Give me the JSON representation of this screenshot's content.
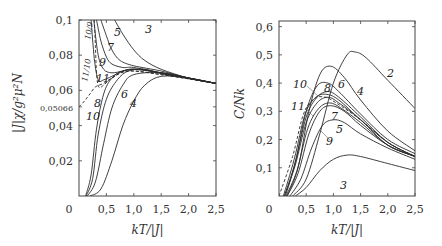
{
  "chart_data": [
    {
      "type": "line",
      "title": "",
      "xlabel": "kT/|J|",
      "ylabel": "|J|χ/g²μ²N",
      "xlim": [
        0,
        2.5
      ],
      "ylim": [
        0,
        0.1
      ],
      "xticks": [
        "0",
        "0,5",
        "1,0",
        "1,5",
        "2,0",
        "2,5"
      ],
      "yticks": [
        "0,02",
        "0,04",
        "0,05066",
        "0,06",
        "0,08",
        "0,1"
      ],
      "grid": false,
      "annotations": [
        "11/10",
        "10/9"
      ],
      "series": [
        {
          "name": "3",
          "style": "solid",
          "x": [
            0.65,
            0.8,
            1.0,
            1.2,
            1.5,
            2.0,
            2.5
          ],
          "y": [
            0.1,
            0.092,
            0.083,
            0.077,
            0.072,
            0.067,
            0.064
          ]
        },
        {
          "name": "5",
          "style": "solid",
          "x": [
            0.4,
            0.5,
            0.6,
            0.75,
            1.0,
            1.5,
            2.0,
            2.5
          ],
          "y": [
            0.1,
            0.091,
            0.083,
            0.077,
            0.074,
            0.071,
            0.067,
            0.064
          ]
        },
        {
          "name": "7",
          "style": "solid",
          "x": [
            0.32,
            0.4,
            0.5,
            0.6,
            0.8,
            1.0,
            1.5,
            2.5
          ],
          "y": [
            0.1,
            0.088,
            0.079,
            0.075,
            0.073,
            0.073,
            0.07,
            0.064
          ]
        },
        {
          "name": "9",
          "style": "solid",
          "x": [
            0.27,
            0.35,
            0.45,
            0.6,
            0.8,
            1.0,
            1.5,
            2.5
          ],
          "y": [
            0.1,
            0.08,
            0.072,
            0.07,
            0.071,
            0.072,
            0.07,
            0.064
          ]
        },
        {
          "name": "11",
          "style": "solid",
          "x": [
            0.22,
            0.28,
            0.35,
            0.45,
            0.6,
            0.8,
            1.0,
            1.5,
            2.5
          ],
          "y": [
            0.1,
            0.078,
            0.066,
            0.066,
            0.068,
            0.071,
            0.072,
            0.07,
            0.064
          ]
        },
        {
          "name": "4",
          "style": "solid",
          "x": [
            0.2,
            0.4,
            0.6,
            0.8,
            1.0,
            1.2,
            1.5,
            2.0,
            2.5
          ],
          "y": [
            0.0,
            0.004,
            0.02,
            0.04,
            0.054,
            0.063,
            0.068,
            0.067,
            0.064
          ]
        },
        {
          "name": "6",
          "style": "solid",
          "x": [
            0.15,
            0.3,
            0.45,
            0.6,
            0.8,
            1.0,
            1.5,
            2.0,
            2.5
          ],
          "y": [
            0.0,
            0.008,
            0.03,
            0.05,
            0.063,
            0.069,
            0.07,
            0.067,
            0.064
          ]
        },
        {
          "name": "8",
          "style": "solid",
          "x": [
            0.13,
            0.25,
            0.35,
            0.5,
            0.7,
            0.9,
            1.2,
            1.6,
            2.5
          ],
          "y": [
            0.0,
            0.01,
            0.035,
            0.055,
            0.066,
            0.071,
            0.072,
            0.069,
            0.064
          ]
        },
        {
          "name": "10",
          "style": "solid",
          "x": [
            0.12,
            0.22,
            0.32,
            0.45,
            0.6,
            0.8,
            1.1,
            1.6,
            2.5
          ],
          "y": [
            0.0,
            0.012,
            0.038,
            0.058,
            0.067,
            0.071,
            0.072,
            0.069,
            0.064
          ]
        },
        {
          "name": "10/9",
          "style": "dashed",
          "x": [
            0.28,
            0.3,
            0.32,
            0.36,
            0.45,
            0.6,
            0.9,
            1.5,
            2.5
          ],
          "y": [
            0.1,
            0.085,
            0.07,
            0.062,
            0.063,
            0.067,
            0.071,
            0.069,
            0.064
          ]
        },
        {
          "name": "11/10",
          "style": "dashed",
          "x": [
            0.0,
            0.1,
            0.2,
            0.3,
            0.45,
            0.6,
            0.9,
            1.5,
            2.5
          ],
          "y": [
            0.05066,
            0.054,
            0.058,
            0.062,
            0.064,
            0.067,
            0.071,
            0.069,
            0.064
          ]
        }
      ]
    },
    {
      "type": "line",
      "title": "",
      "xlabel": "kT/|J|",
      "ylabel": "C/Nk",
      "xlim": [
        0,
        2.5
      ],
      "ylim": [
        0,
        0.62
      ],
      "xticks": [
        "0",
        "0,5",
        "1,0",
        "1,5",
        "2,0",
        "2,5"
      ],
      "yticks": [
        "0,1",
        "0,2",
        "0,3",
        "0,4",
        "0,5",
        "0,6"
      ],
      "grid": false,
      "series": [
        {
          "name": "2",
          "style": "solid",
          "x": [
            0.25,
            0.5,
            0.75,
            1.0,
            1.25,
            1.4,
            1.6,
            2.0,
            2.5
          ],
          "y": [
            0.0,
            0.06,
            0.22,
            0.4,
            0.5,
            0.51,
            0.49,
            0.41,
            0.31
          ]
        },
        {
          "name": "3",
          "style": "solid",
          "x": [
            0.3,
            0.5,
            0.75,
            1.0,
            1.25,
            1.5,
            2.0,
            2.5
          ],
          "y": [
            0.0,
            0.03,
            0.09,
            0.13,
            0.145,
            0.14,
            0.115,
            0.09
          ]
        },
        {
          "name": "4",
          "style": "solid",
          "x": [
            0.15,
            0.35,
            0.55,
            0.75,
            0.95,
            1.2,
            1.5,
            2.0,
            2.5
          ],
          "y": [
            0.0,
            0.1,
            0.3,
            0.43,
            0.46,
            0.42,
            0.34,
            0.23,
            0.16
          ]
        },
        {
          "name": "5",
          "style": "solid",
          "x": [
            0.2,
            0.4,
            0.6,
            0.8,
            1.0,
            1.2,
            1.5,
            2.0,
            2.5
          ],
          "y": [
            0.0,
            0.06,
            0.17,
            0.25,
            0.27,
            0.26,
            0.22,
            0.17,
            0.13
          ]
        },
        {
          "name": "6",
          "style": "solid",
          "x": [
            0.12,
            0.3,
            0.5,
            0.7,
            0.9,
            1.1,
            1.5,
            2.0,
            2.5
          ],
          "y": [
            0.0,
            0.12,
            0.3,
            0.39,
            0.4,
            0.37,
            0.29,
            0.2,
            0.15
          ]
        },
        {
          "name": "7",
          "style": "solid",
          "x": [
            0.15,
            0.35,
            0.55,
            0.75,
            0.95,
            1.2,
            1.5,
            2.0,
            2.5
          ],
          "y": [
            0.0,
            0.08,
            0.22,
            0.3,
            0.32,
            0.3,
            0.25,
            0.18,
            0.14
          ]
        },
        {
          "name": "8",
          "style": "solid",
          "x": [
            0.1,
            0.3,
            0.5,
            0.7,
            0.9,
            1.1,
            1.5,
            2.0,
            2.5
          ],
          "y": [
            0.0,
            0.12,
            0.28,
            0.35,
            0.37,
            0.35,
            0.28,
            0.19,
            0.14
          ]
        },
        {
          "name": "9",
          "style": "solid",
          "x": [
            0.13,
            0.33,
            0.53,
            0.73,
            0.93,
            1.15,
            1.5,
            2.0,
            2.5
          ],
          "y": [
            0.0,
            0.09,
            0.24,
            0.31,
            0.33,
            0.31,
            0.26,
            0.18,
            0.14
          ]
        },
        {
          "name": "10",
          "style": "solid",
          "x": [
            0.08,
            0.28,
            0.48,
            0.68,
            0.88,
            1.1,
            1.5,
            2.0,
            2.5
          ],
          "y": [
            0.0,
            0.13,
            0.29,
            0.35,
            0.36,
            0.34,
            0.27,
            0.19,
            0.14
          ]
        },
        {
          "name": "11",
          "style": "solid",
          "x": [
            0.1,
            0.3,
            0.5,
            0.7,
            0.9,
            1.1,
            1.5,
            2.0,
            2.5
          ],
          "y": [
            0.0,
            0.11,
            0.26,
            0.33,
            0.35,
            0.33,
            0.27,
            0.18,
            0.14
          ]
        },
        {
          "name": "limit",
          "style": "dashed",
          "x": [
            0.0,
            0.25,
            0.45,
            0.65,
            0.85,
            1.05,
            1.5,
            2.0,
            2.5
          ],
          "y": [
            0.0,
            0.14,
            0.29,
            0.345,
            0.35,
            0.33,
            0.27,
            0.19,
            0.14
          ]
        }
      ]
    }
  ],
  "plots": [
    {
      "ylabel": "|J|χ/g²μ²N",
      "xlabel": "kT/|J|",
      "zero_label": "0",
      "ytick_labels": [
        {
          "label": "0,1",
          "v": 0.1
        },
        {
          "label": "0,08",
          "v": 0.08
        },
        {
          "label": "0,06",
          "v": 0.06
        },
        {
          "label": "0,05066",
          "v": 0.05066,
          "small": true
        },
        {
          "label": "0,04",
          "v": 0.04
        },
        {
          "label": "0,02",
          "v": 0.02
        }
      ],
      "xtick_labels": [
        "0,5",
        "1,0",
        "1,5",
        "2,0",
        "2,5"
      ],
      "curve_labels": [
        {
          "text": "3",
          "x": 145,
          "y": 33
        },
        {
          "text": "5",
          "x": 114,
          "y": 36
        },
        {
          "text": "7",
          "x": 107,
          "y": 51
        },
        {
          "text": "9",
          "x": 99,
          "y": 66
        },
        {
          "text": "11",
          "x": 96,
          "y": 82
        },
        {
          "text": "8",
          "x": 94,
          "y": 107
        },
        {
          "text": "10",
          "x": 86,
          "y": 120
        },
        {
          "text": "6",
          "x": 121,
          "y": 98
        },
        {
          "text": "4",
          "x": 130,
          "y": 107
        },
        {
          "text": "10/9",
          "x": 90,
          "y": 40,
          "rot": -80,
          "small": true
        },
        {
          "text": "11/10",
          "x": 87,
          "y": 82,
          "rot": -80,
          "small": true
        }
      ]
    },
    {
      "ylabel": "C/Nk",
      "xlabel": "kT/|J|",
      "zero_label": "0",
      "ytick_labels": [
        {
          "label": "0,6",
          "v": 0.6
        },
        {
          "label": "0,5",
          "v": 0.5
        },
        {
          "label": "0,4",
          "v": 0.4
        },
        {
          "label": "0,3",
          "v": 0.3
        },
        {
          "label": "0,2",
          "v": 0.2
        },
        {
          "label": "0,1",
          "v": 0.1
        }
      ],
      "xtick_labels": [
        "0,5",
        "1,0",
        "1,5",
        "2,0",
        "2,5"
      ],
      "curve_labels": [
        {
          "text": "2",
          "x": 387,
          "y": 77
        },
        {
          "text": "4",
          "x": 357,
          "y": 95
        },
        {
          "text": "6",
          "x": 338,
          "y": 88
        },
        {
          "text": "8",
          "x": 324,
          "y": 92
        },
        {
          "text": "10",
          "x": 293,
          "y": 88
        },
        {
          "text": "11",
          "x": 291,
          "y": 110
        },
        {
          "text": "7",
          "x": 331,
          "y": 120
        },
        {
          "text": "5",
          "x": 336,
          "y": 133
        },
        {
          "text": "9",
          "x": 326,
          "y": 145
        },
        {
          "text": "3",
          "x": 340,
          "y": 189
        }
      ]
    }
  ]
}
